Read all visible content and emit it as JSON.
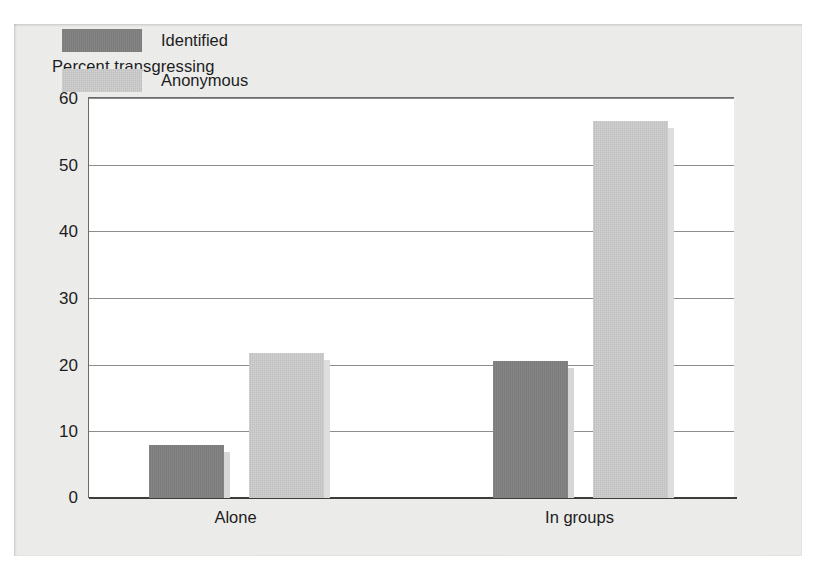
{
  "chart_data": {
    "type": "bar",
    "title": "",
    "ylabel": "Percent transgressing",
    "xlabel": "",
    "categories": [
      "Alone",
      "In groups"
    ],
    "series": [
      {
        "name": "Identified",
        "values": [
          8,
          20.5
        ],
        "color": "#7e7e7e"
      },
      {
        "name": "Anonymous",
        "values": [
          21.8,
          56.5
        ],
        "color": "#c7c7c7"
      }
    ],
    "ylim": [
      0,
      60
    ],
    "yticks": [
      0,
      10,
      20,
      30,
      40,
      50,
      60
    ],
    "ytick_labels": [
      "0",
      "10",
      "20",
      "30",
      "40",
      "50",
      "60"
    ],
    "grid": true,
    "grid_axis": "y",
    "legend_position": "upper-left-inside",
    "annotations": []
  },
  "axis": {
    "y_title": "Percent transgressing",
    "ticks": [
      {
        "value": 60,
        "label": "60"
      },
      {
        "value": 50,
        "label": "50"
      },
      {
        "value": 40,
        "label": "40"
      },
      {
        "value": 30,
        "label": "30"
      },
      {
        "value": 20,
        "label": "20"
      },
      {
        "value": 10,
        "label": "10"
      },
      {
        "value": 0,
        "label": "0"
      }
    ],
    "categories": [
      {
        "label": "Alone"
      },
      {
        "label": "In groups"
      }
    ]
  },
  "legend": {
    "entries": [
      {
        "label": "Identified",
        "color": "#7e7e7e"
      },
      {
        "label": "Anonymous",
        "color": "#c7c7c7"
      }
    ]
  },
  "bars": [
    {
      "group": "Alone",
      "series": "Identified",
      "value": 8,
      "label": "8"
    },
    {
      "group": "Alone",
      "series": "Anonymous",
      "value": 21.8,
      "label": "21.8"
    },
    {
      "group": "In groups",
      "series": "Identified",
      "value": 20.5,
      "label": "20.5"
    },
    {
      "group": "In groups",
      "series": "Anonymous",
      "value": 56.5,
      "label": "56.5"
    }
  ],
  "colors": {
    "identified": "#7e7e7e",
    "anonymous": "#c7c7c7",
    "paper": "#ececeb",
    "plot_background": "#ffffff",
    "gridline": "#8d8d8d",
    "axis": "#3c3c3c",
    "text": "#1d1d1d"
  }
}
